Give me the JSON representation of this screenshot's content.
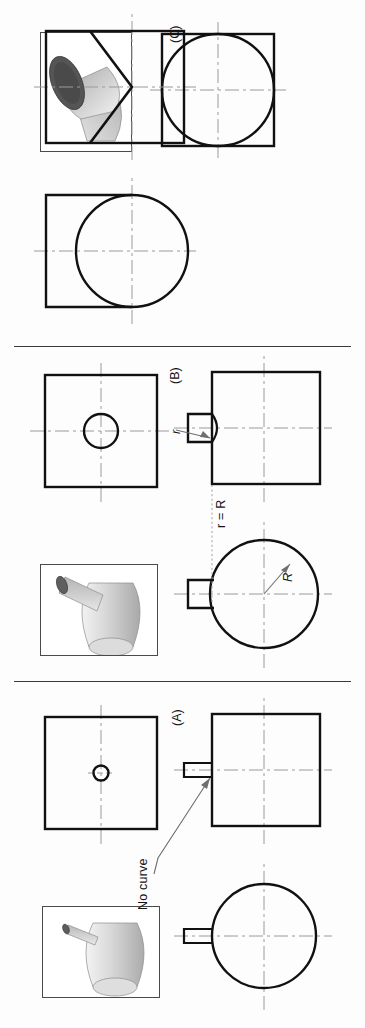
{
  "figure": {
    "panels": [
      {
        "id": "A",
        "id_label": "(A)",
        "pictorial_name": "small-cylinder-on-large-cylinder-pictorial",
        "annotations": [
          {
            "name": "no-curve-note",
            "text": "No curve"
          }
        ],
        "views": [
          {
            "name": "top-view-circle-with-boss",
            "shape": "circle-with-rectangular-boss"
          },
          {
            "name": "front-view-square-with-boss",
            "shape": "square-with-rectangular-boss"
          },
          {
            "name": "side-view-square-with-small-hole",
            "shape": "square-with-small-circle"
          }
        ]
      },
      {
        "id": "B",
        "id_label": "(B)",
        "pictorial_name": "medium-cylinder-on-large-cylinder-pictorial",
        "annotations": [
          {
            "name": "radius-equality-note",
            "text": "r = R"
          },
          {
            "name": "large-radius-label",
            "text": "R"
          },
          {
            "name": "small-radius-label",
            "text": "r"
          }
        ],
        "views": [
          {
            "name": "top-view-circle-with-boss",
            "shape": "circle-with-rectangular-boss"
          },
          {
            "name": "front-view-square-with-boss",
            "shape": "square-with-rectangular-boss-and-curve"
          },
          {
            "name": "side-view-square-with-circle",
            "shape": "square-with-circle"
          }
        ]
      },
      {
        "id": "C",
        "id_label": "(C)",
        "pictorial_name": "equal-diameter-cylinder-intersection-pictorial",
        "annotations": [],
        "views": [
          {
            "name": "top-view-rectangle-with-circle",
            "shape": "rectangle-with-protruding-circle"
          },
          {
            "name": "front-view-rectangle-with-vee",
            "shape": "rectangle-with-vee"
          },
          {
            "name": "side-view-square-with-inscribed-circle",
            "shape": "square-with-inscribed-circle"
          }
        ]
      }
    ],
    "colors": {
      "outline": "#111111",
      "centerline": "#9a9a9a",
      "hidden_line": "#8f8f8f",
      "leader": "#6e6e6e",
      "divider": "#3a3a3a",
      "pictorial_light": "#e8e8e8",
      "pictorial_mid": "#b9b9b9",
      "pictorial_dark": "#5c5c5c"
    }
  }
}
